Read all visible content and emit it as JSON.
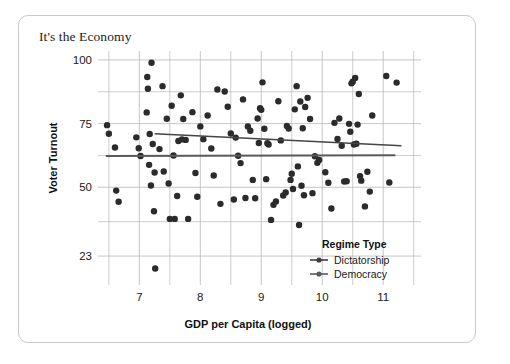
{
  "card": {
    "title": "It's the Economy"
  },
  "chart_data": {
    "type": "scatter",
    "title": "It's the Economy",
    "xlabel": "GDP per Capita (logged)",
    "ylabel": "Voter Turnout",
    "xlim": [
      6.42,
      11.62
    ],
    "ylim": [
      14.0,
      103.5
    ],
    "xticks": [
      7,
      8,
      9,
      10,
      11
    ],
    "xtick_labels": [
      "7",
      "8",
      "9",
      "10",
      "11"
    ],
    "xminor_ticks": [
      6.5,
      7.5,
      8.5,
      9.5,
      10.5,
      11.5
    ],
    "yticks": [
      23,
      50,
      75,
      100
    ],
    "ytick_labels": [
      "23",
      "50",
      "75",
      "100"
    ],
    "yminor_ticks": [
      36.5,
      62.5,
      87.5
    ],
    "grid": true,
    "grid_color": "#b8b8b8",
    "point_color": "#2b2b2b",
    "point_size": 3.2,
    "legend": {
      "title": "Regime Type",
      "position": "inside-bottom-right",
      "entries": [
        {
          "name": "Dictatorship",
          "color": "#3d3d3d"
        },
        {
          "name": "Democracy",
          "color": "#5a5a5a"
        }
      ]
    },
    "trend_lines": [
      {
        "name": "Dictatorship",
        "color": "#454545",
        "width": 1.6,
        "x0": 7.25,
        "y0": 71.0,
        "x1": 11.3,
        "y1": 66.3
      },
      {
        "name": "Democracy",
        "color": "#5a5a5a",
        "width": 1.9,
        "x0": 6.45,
        "y0": 62.3,
        "x1": 11.2,
        "y1": 62.6
      }
    ],
    "series": [
      {
        "name": "Observations",
        "points": [
          [
            6.47,
            74.4
          ],
          [
            6.5,
            71.0
          ],
          [
            6.6,
            65.6
          ],
          [
            6.62,
            48.7
          ],
          [
            6.66,
            44.3
          ],
          [
            6.95,
            69.6
          ],
          [
            6.99,
            65.3
          ],
          [
            7.02,
            62.3
          ],
          [
            7.12,
            79.4
          ],
          [
            7.13,
            93.3
          ],
          [
            7.14,
            88.7
          ],
          [
            7.16,
            58.8
          ],
          [
            7.17,
            70.9
          ],
          [
            7.19,
            50.7
          ],
          [
            7.2,
            98.9
          ],
          [
            7.22,
            67.0
          ],
          [
            7.24,
            40.6
          ],
          [
            7.25,
            55.8
          ],
          [
            7.26,
            18.1
          ],
          [
            7.33,
            65.0
          ],
          [
            7.38,
            89.7
          ],
          [
            7.4,
            56.2
          ],
          [
            7.45,
            76.9
          ],
          [
            7.48,
            51.5
          ],
          [
            7.5,
            37.6
          ],
          [
            7.53,
            82.0
          ],
          [
            7.56,
            62.5
          ],
          [
            7.58,
            37.6
          ],
          [
            7.62,
            46.6
          ],
          [
            7.64,
            68.2
          ],
          [
            7.68,
            86.1
          ],
          [
            7.7,
            68.8
          ],
          [
            7.72,
            76.8
          ],
          [
            7.76,
            68.6
          ],
          [
            7.8,
            37.6
          ],
          [
            7.87,
            79.5
          ],
          [
            7.92,
            55.6
          ],
          [
            7.95,
            46.3
          ],
          [
            8.0,
            73.9
          ],
          [
            8.05,
            68.9
          ],
          [
            8.12,
            78.2
          ],
          [
            8.18,
            65.2
          ],
          [
            8.22,
            54.6
          ],
          [
            8.28,
            88.4
          ],
          [
            8.33,
            43.5
          ],
          [
            8.4,
            87.6
          ],
          [
            8.45,
            81.6
          ],
          [
            8.5,
            71.1
          ],
          [
            8.55,
            45.2
          ],
          [
            8.58,
            69.5
          ],
          [
            8.62,
            62.4
          ],
          [
            8.66,
            59.5
          ],
          [
            8.7,
            84.5
          ],
          [
            8.74,
            45.8
          ],
          [
            8.78,
            73.9
          ],
          [
            8.82,
            72.2
          ],
          [
            8.86,
            52.9
          ],
          [
            8.9,
            45.7
          ],
          [
            8.94,
            77.0
          ],
          [
            8.96,
            67.4
          ],
          [
            8.98,
            81.0
          ],
          [
            9.0,
            80.4
          ],
          [
            9.02,
            91.2
          ],
          [
            9.05,
            73.0
          ],
          [
            9.08,
            53.2
          ],
          [
            9.1,
            67.3
          ],
          [
            9.12,
            66.8
          ],
          [
            9.16,
            37.2
          ],
          [
            9.2,
            43.1
          ],
          [
            9.24,
            44.4
          ],
          [
            9.28,
            83.8
          ],
          [
            9.32,
            68.4
          ],
          [
            9.36,
            46.8
          ],
          [
            9.4,
            48.0
          ],
          [
            9.42,
            74.1
          ],
          [
            9.45,
            73.1
          ],
          [
            9.48,
            52.9
          ],
          [
            9.5,
            55.3
          ],
          [
            9.52,
            49.3
          ],
          [
            9.55,
            80.6
          ],
          [
            9.58,
            89.7
          ],
          [
            9.6,
            58.2
          ],
          [
            9.62,
            35.2
          ],
          [
            9.64,
            83.7
          ],
          [
            9.66,
            50.6
          ],
          [
            9.68,
            73.2
          ],
          [
            9.7,
            46.9
          ],
          [
            9.72,
            81.5
          ],
          [
            9.76,
            85.1
          ],
          [
            9.8,
            76.8
          ],
          [
            9.84,
            47.7
          ],
          [
            9.88,
            62.2
          ],
          [
            9.92,
            59.6
          ],
          [
            9.95,
            60.7
          ],
          [
            10.05,
            55.9
          ],
          [
            10.1,
            51.8
          ],
          [
            10.15,
            41.7
          ],
          [
            10.2,
            75.3
          ],
          [
            10.25,
            69.0
          ],
          [
            10.28,
            77.0
          ],
          [
            10.32,
            66.3
          ],
          [
            10.36,
            52.3
          ],
          [
            10.4,
            52.4
          ],
          [
            10.44,
            74.9
          ],
          [
            10.46,
            71.8
          ],
          [
            10.48,
            90.8
          ],
          [
            10.5,
            91.4
          ],
          [
            10.52,
            66.8
          ],
          [
            10.54,
            92.9
          ],
          [
            10.56,
            67.1
          ],
          [
            10.58,
            74.6
          ],
          [
            10.6,
            86.6
          ],
          [
            10.62,
            54.4
          ],
          [
            10.64,
            52.6
          ],
          [
            10.7,
            42.5
          ],
          [
            10.74,
            56.1
          ],
          [
            10.78,
            48.3
          ],
          [
            10.82,
            78.2
          ],
          [
            11.05,
            93.7
          ],
          [
            11.1,
            51.9
          ],
          [
            11.22,
            91.1
          ]
        ]
      }
    ]
  }
}
